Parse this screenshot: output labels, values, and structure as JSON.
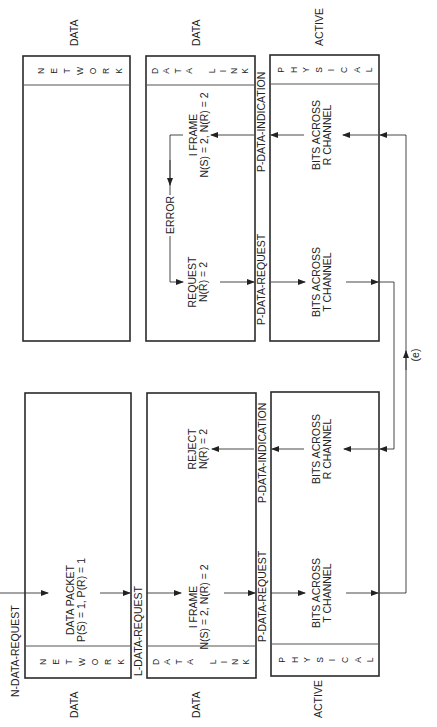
{
  "diagram": {
    "orientation": "rotated-90-ccw",
    "stations": [
      {
        "id": "station-a",
        "layers": [
          {
            "name": "NETWORK",
            "state": "DATA",
            "content": [
              "DATA PACKET",
              "P(S) = 1, P(R) = 1"
            ]
          },
          {
            "name": "DATA LINK",
            "state": "DATA",
            "content": [
              "I FRAME",
              "N(S) = 2, N(R) = 2"
            ],
            "content2": [
              "REJECT",
              "N(R) = 2"
            ]
          },
          {
            "name": "PHYSICAL",
            "state": "ACTIVE",
            "content": [
              "BITS ACROSS",
              "T CHANNEL"
            ],
            "content2": [
              "BITS ACROSS",
              "R CHANNEL"
            ]
          }
        ]
      },
      {
        "id": "station-b",
        "layers": [
          {
            "name": "NETWORK",
            "state": "DATA"
          },
          {
            "name": "DATA LINK",
            "state": "DATA",
            "content": [
              "I FRAME",
              "N(S) = 2, N(R) = 2"
            ],
            "content2": [
              "REQUEST",
              "N(R) = 2"
            ],
            "error": "ERROR"
          },
          {
            "name": "PHYSICAL",
            "state": "ACTIVE",
            "content": [
              "BITS ACROSS",
              "R CHANNEL"
            ],
            "content2": [
              "BITS ACROSS",
              "T CHANNEL"
            ]
          }
        ]
      }
    ],
    "primitives": {
      "n_data_request": "N-DATA-REQUEST",
      "l_data_request": "L-DATA-REQUEST",
      "p_data_request": "P-DATA-REQUEST",
      "p_data_indication": "P-DATA-INDICATION"
    },
    "link_label": "(e)",
    "layer_letters": {
      "network": [
        "N",
        "E",
        "T",
        "W",
        "O",
        "R",
        "K"
      ],
      "datalink": [
        "D",
        "A",
        "T",
        "A",
        "",
        "L",
        "I",
        "N",
        "K"
      ],
      "physical": [
        "P",
        "H",
        "Y",
        "S",
        "I",
        "C",
        "A",
        "L"
      ]
    }
  }
}
